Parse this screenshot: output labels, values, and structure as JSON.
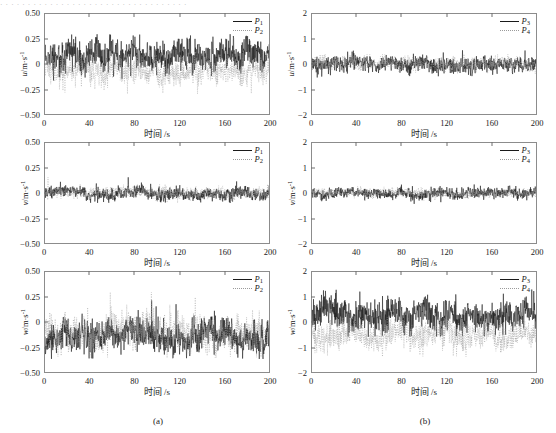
{
  "figure": {
    "top_cut_text": "· · · · · · · · · · · · · · · · · · · · · · · · · · · · · · · · · ·",
    "captions": [
      {
        "label": "(a)",
        "x": 158,
        "y": 416
      },
      {
        "label": "(b)",
        "x": 425,
        "y": 416
      }
    ]
  },
  "axis": {
    "xlabel": "时间 /s",
    "xticks": [
      "0",
      "40",
      "80",
      "120",
      "160",
      "200"
    ],
    "xvalues": [
      0,
      40,
      80,
      120,
      160,
      200
    ],
    "xlim": [
      0,
      200
    ],
    "left_yticks": [
      "0.50",
      "0.25",
      "0",
      "-0.25",
      "-0.50"
    ],
    "left_yvalues": [
      0.5,
      0.25,
      0,
      -0.25,
      -0.5
    ],
    "left_ylim": [
      -0.5,
      0.5
    ],
    "right_yticks": [
      "2",
      "1",
      "0",
      "-1",
      "-2"
    ],
    "right_yvalues": [
      2,
      1,
      0,
      -1,
      -2
    ],
    "right_ylim": [
      -2,
      2
    ],
    "ylabel_u": "u/m·s⁻¹",
    "ylabel_v": "v/m·s⁻¹",
    "ylabel_w": "w/m·s⁻¹"
  },
  "legend": {
    "left": [
      {
        "name": "P1",
        "label": "P",
        "subscript": "1",
        "style": "solid",
        "color": "#1a1a1a"
      },
      {
        "name": "P2",
        "label": "P",
        "subscript": "2",
        "style": "dotted",
        "color": "#9a9a9a"
      }
    ],
    "right": [
      {
        "name": "P3",
        "label": "P",
        "subscript": "3",
        "style": "solid",
        "color": "#1a1a1a"
      },
      {
        "name": "P4",
        "label": "P",
        "subscript": "4",
        "style": "dotted",
        "color": "#9a9a9a"
      }
    ]
  },
  "chart_data": [
    {
      "id": "a-u",
      "type": "line",
      "panel": "(a)",
      "title": "",
      "xlabel": "时间 /s",
      "ylabel": "u/m·s⁻¹",
      "xlim": [
        0,
        200
      ],
      "ylim": [
        -0.5,
        0.5
      ],
      "grid": false,
      "legend_position": "top-right",
      "series": [
        {
          "name": "P1",
          "style": "solid",
          "color": "#1a1a1a",
          "mean": 0.08,
          "sd": 0.075,
          "min": -0.17,
          "max": 0.3
        },
        {
          "name": "P2",
          "style": "dotted",
          "color": "#9a9a9a",
          "mean": -0.06,
          "sd": 0.06,
          "min": -0.3,
          "max": 0.1
        }
      ]
    },
    {
      "id": "a-v",
      "type": "line",
      "panel": "(a)",
      "title": "",
      "xlabel": "时间 /s",
      "ylabel": "v/m·s⁻¹",
      "xlim": [
        0,
        200
      ],
      "ylim": [
        -0.5,
        0.5
      ],
      "grid": false,
      "legend_position": "top-right",
      "series": [
        {
          "name": "P1",
          "style": "solid",
          "color": "#1a1a1a",
          "mean": -0.005,
          "sd": 0.03,
          "min": -0.1,
          "max": 0.16
        },
        {
          "name": "P2",
          "style": "dotted",
          "color": "#9a9a9a",
          "mean": 0.0,
          "sd": 0.028,
          "min": -0.1,
          "max": 0.2
        }
      ]
    },
    {
      "id": "a-w",
      "type": "line",
      "panel": "(a)",
      "title": "",
      "xlabel": "时间 /s",
      "ylabel": "w/m·s⁻¹",
      "xlim": [
        0,
        200
      ],
      "ylim": [
        -0.5,
        0.5
      ],
      "grid": false,
      "legend_position": "top-right",
      "series": [
        {
          "name": "P1",
          "style": "solid",
          "color": "#1a1a1a",
          "mean": -0.13,
          "sd": 0.075,
          "min": -0.37,
          "max": 0.22
        },
        {
          "name": "P2",
          "style": "dotted",
          "color": "#9a9a9a",
          "mean": -0.11,
          "sd": 0.085,
          "min": -0.36,
          "max": 0.3
        }
      ]
    },
    {
      "id": "b-u",
      "type": "line",
      "panel": "(b)",
      "title": "",
      "xlabel": "时间 /s",
      "ylabel": "u/m·s⁻¹",
      "xlim": [
        0,
        200
      ],
      "ylim": [
        -2,
        2
      ],
      "grid": false,
      "legend_position": "top-right",
      "series": [
        {
          "name": "P3",
          "style": "solid",
          "color": "#1a1a1a",
          "mean": 0.0,
          "sd": 0.15,
          "min": -0.55,
          "max": 0.55
        },
        {
          "name": "P4",
          "style": "dotted",
          "color": "#9a9a9a",
          "mean": 0.0,
          "sd": 0.12,
          "min": -0.4,
          "max": 0.4
        }
      ]
    },
    {
      "id": "b-v",
      "type": "line",
      "panel": "(b)",
      "title": "",
      "xlabel": "时间 /s",
      "ylabel": "v/m·s⁻¹",
      "xlim": [
        0,
        200
      ],
      "ylim": [
        -2,
        2
      ],
      "grid": false,
      "legend_position": "top-right",
      "series": [
        {
          "name": "P3",
          "style": "solid",
          "color": "#1a1a1a",
          "mean": -0.02,
          "sd": 0.1,
          "min": -0.45,
          "max": 0.35
        },
        {
          "name": "P4",
          "style": "dotted",
          "color": "#9a9a9a",
          "mean": 0.0,
          "sd": 0.08,
          "min": -0.3,
          "max": 0.3
        }
      ]
    },
    {
      "id": "b-w",
      "type": "line",
      "panel": "(b)",
      "title": "",
      "xlabel": "时间 /s",
      "ylabel": "w/m·s⁻¹",
      "xlim": [
        0,
        200
      ],
      "ylim": [
        -2,
        2
      ],
      "grid": false,
      "legend_position": "top-right",
      "series": [
        {
          "name": "P3",
          "style": "solid",
          "color": "#1a1a1a",
          "mean": 0.3,
          "sd": 0.3,
          "min": -0.6,
          "max": 1.3
        },
        {
          "name": "P4",
          "style": "dotted",
          "color": "#9a9a9a",
          "mean": -0.5,
          "sd": 0.28,
          "min": -1.4,
          "max": 0.2
        }
      ]
    }
  ],
  "layout": {
    "panels": [
      {
        "id": "a-u",
        "left": 44,
        "top": 13,
        "width": 226,
        "height": 102,
        "yaxis": "left",
        "ylabel": "u/m·s⁻¹",
        "legend": "left"
      },
      {
        "id": "b-u",
        "left": 311,
        "top": 13,
        "width": 226,
        "height": 102,
        "yaxis": "right",
        "ylabel": "u/m·s⁻¹",
        "legend": "right"
      },
      {
        "id": "a-v",
        "left": 44,
        "top": 142,
        "width": 226,
        "height": 102,
        "yaxis": "left",
        "ylabel": "v/m·s⁻¹",
        "legend": "left"
      },
      {
        "id": "b-v",
        "left": 311,
        "top": 142,
        "width": 226,
        "height": 102,
        "yaxis": "right",
        "ylabel": "v/m·s⁻¹",
        "legend": "right"
      },
      {
        "id": "a-w",
        "left": 44,
        "top": 271,
        "width": 226,
        "height": 102,
        "yaxis": "left",
        "ylabel": "w/m·s⁻¹",
        "legend": "left"
      },
      {
        "id": "b-w",
        "left": 311,
        "top": 271,
        "width": 226,
        "height": 102,
        "yaxis": "right",
        "ylabel": "w/m·s⁻¹",
        "legend": "right"
      }
    ]
  }
}
